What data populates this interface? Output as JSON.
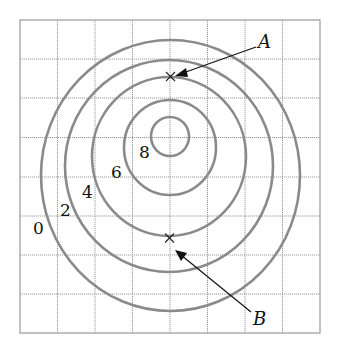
{
  "diagram": {
    "type": "contour-map",
    "grid": {
      "columns": 8,
      "rows": 8
    },
    "contours": [
      {
        "label": "0",
        "value": 0
      },
      {
        "label": "2",
        "value": 2
      },
      {
        "label": "4",
        "value": 4
      },
      {
        "label": "6",
        "value": 6
      },
      {
        "label": "8",
        "value": 8
      }
    ],
    "points": [
      {
        "label": "A",
        "on_contour": 4,
        "position": "top of contour 4"
      },
      {
        "label": "B",
        "on_contour": 4,
        "position": "bottom of contour 4"
      }
    ],
    "colors": {
      "grid": "#9a9a9a",
      "contour": "#8a8a8a",
      "ink": "#111111"
    }
  }
}
